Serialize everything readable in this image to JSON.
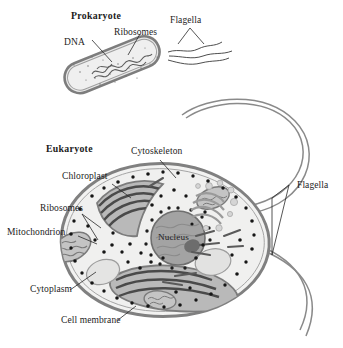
{
  "figure": {
    "background_color": "#ffffff",
    "ink_color": "#2a2a2a"
  },
  "prokaryote": {
    "heading": "Prokaryote",
    "labels": {
      "dna": "DNA",
      "ribosomes": "Ribosomes",
      "flagella": "Flagella"
    },
    "flagella_count": 3,
    "colors": {
      "wall": "#8d8d8d",
      "cytoplasm": "#e9e9e9",
      "dna": "#6e6e6e"
    }
  },
  "eukaryote": {
    "heading": "Eukaryote",
    "labels": {
      "cytoskeleton": "Cytoskeleton",
      "chloroplast": "Chloroplast",
      "ribosomes": "Ribosomes",
      "mitochondrion": "Mitochondrion",
      "cytoplasm": "Cytoplasm",
      "cell_membrane": "Cell membrane",
      "nucleus": "Nucleus",
      "flagella": "Flagella"
    },
    "flagella_count": 2,
    "colors": {
      "membrane": "#8a8a8a",
      "cytoplasm": "#f0f0ef",
      "nucleus": "#9a9a9a",
      "chloroplast": "#a0a0a0",
      "thylakoid": "#4f4f4f",
      "mitochondrion": "#b4b4b4",
      "golgi": "#a8a8a8",
      "vesicle": "#dcdcdc",
      "ribosome_dot": "#1e1e1e"
    }
  }
}
